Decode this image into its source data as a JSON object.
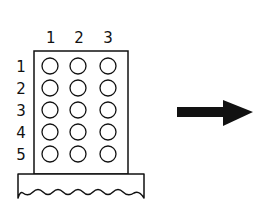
{
  "diagram": {
    "type": "pegboard-grid-with-arrow",
    "column_labels": [
      "1",
      "2",
      "3"
    ],
    "row_labels": [
      "1",
      "2",
      "3",
      "4",
      "5"
    ],
    "holes": {
      "rows": 5,
      "columns": 3,
      "state": "empty"
    },
    "base": {
      "edge_style": "wavy"
    },
    "arrow": {
      "direction": "right",
      "color": "#111111"
    },
    "colors": {
      "stroke": "#111111",
      "background": "#ffffff"
    }
  }
}
